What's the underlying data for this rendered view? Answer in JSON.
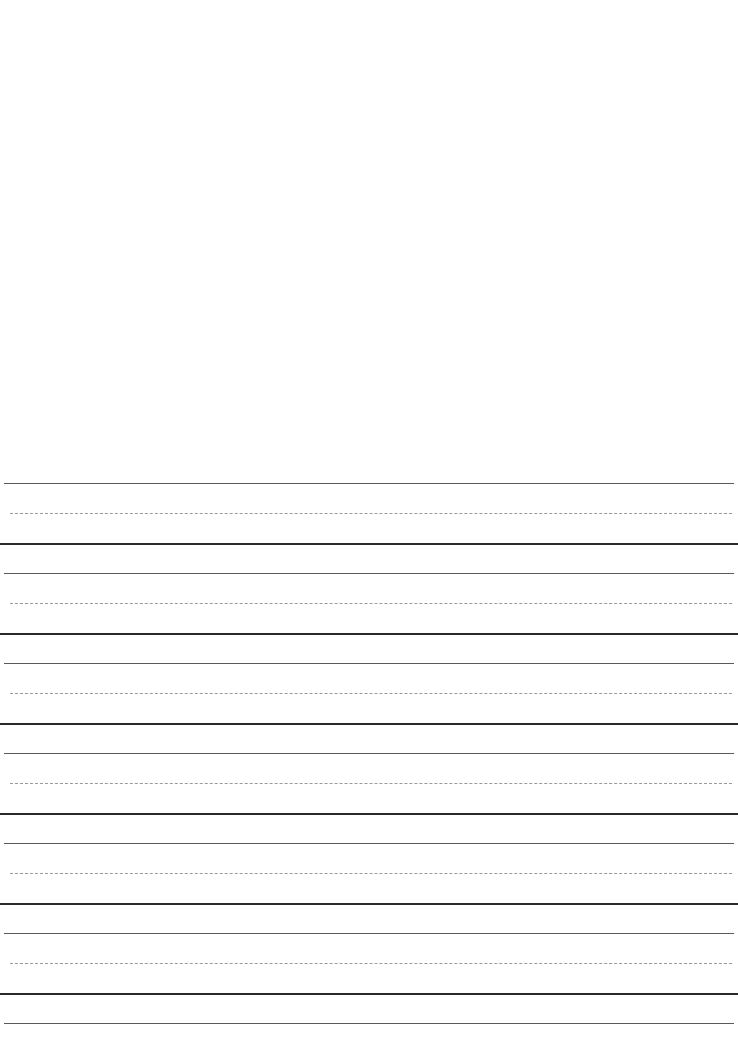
{
  "document": {
    "type": "handwriting practice sheet",
    "sections": {
      "drawing_area": {
        "label": "blank drawing area",
        "content": ""
      },
      "ruled_area": {
        "label": "handwriting lines",
        "line_groups": 6,
        "line_pattern": [
          "top-solid-thin",
          "midline-dashed",
          "baseline-solid-thick"
        ],
        "trailing_line": "top-solid-thin"
      }
    },
    "colors": {
      "paper": "#ffffff",
      "top_line": "#5a5a5a",
      "mid_line": "#9a9a9a",
      "base_line": "#2a2a2a"
    }
  }
}
